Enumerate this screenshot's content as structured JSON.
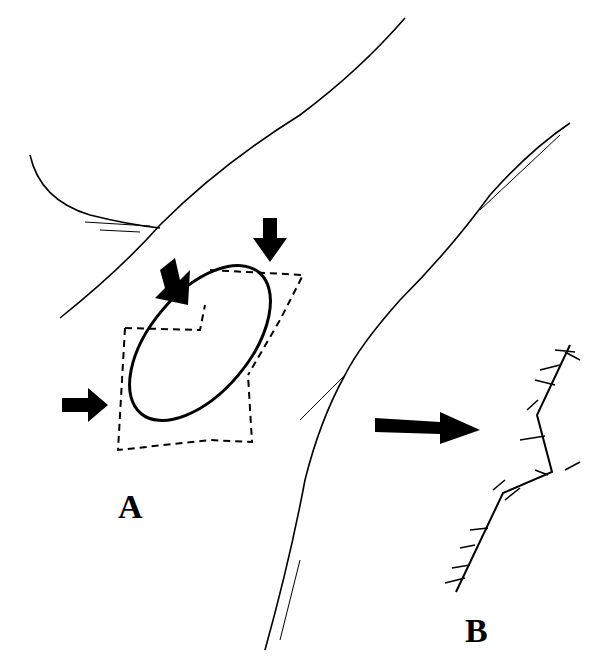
{
  "figure": {
    "panels": [
      {
        "id": "A",
        "label": "A",
        "description": "Elliptical defect with dashed flap outlines and four directional arrows"
      },
      {
        "id": "B",
        "label": "B",
        "description": "Zig-zag sutured closure line"
      }
    ],
    "transition_arrow": "right-arrow",
    "colors": {
      "ink": "#000000",
      "background": "#ffffff"
    }
  }
}
